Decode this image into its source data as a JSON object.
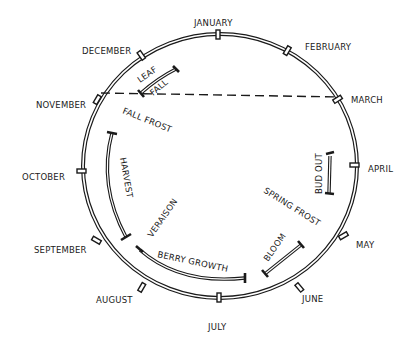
{
  "diagram": {
    "type": "annual-cycle-wheel",
    "months": [
      {
        "label": "JANUARY"
      },
      {
        "label": "FEBRUARY"
      },
      {
        "label": "MARCH"
      },
      {
        "label": "APRIL"
      },
      {
        "label": "MAY"
      },
      {
        "label": "JUNE"
      },
      {
        "label": "JULY"
      },
      {
        "label": "AUGUST"
      },
      {
        "label": "SEPTEMBER"
      },
      {
        "label": "OCTOBER"
      },
      {
        "label": "NOVEMBER"
      },
      {
        "label": "DECEMBER"
      }
    ],
    "stages": [
      {
        "label": "BUD OUT"
      },
      {
        "label": "SPRING FROST"
      },
      {
        "label": "BLOOM"
      },
      {
        "label": "BERRY GROWTH"
      },
      {
        "label": "VERAISON"
      },
      {
        "label": "HARVEST"
      },
      {
        "label": "FALL FROST"
      },
      {
        "label": "LEAF"
      },
      {
        "label": "FALL"
      }
    ],
    "divider": "dashed line from NOVEMBER to MARCH"
  }
}
